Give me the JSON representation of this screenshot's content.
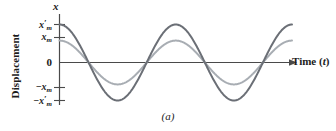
{
  "figure": {
    "caption": "(a)",
    "x_axis_symbol": "x",
    "x_axis_title": "Time (t)",
    "x_axis_title_main": "Time (",
    "x_axis_title_var": "t",
    "x_axis_title_end": ")",
    "y_axis_title": "Displacement"
  },
  "ticks": {
    "top_prime": "x′m",
    "top_prime_base": "x",
    "top_prime_mark": "′",
    "top_prime_sub": "m",
    "top_plain_base": "x",
    "top_plain_sub": "m",
    "zero": "0",
    "bottom_plain_base": "−x",
    "bottom_plain_sub": "m",
    "bottom_prime_base": "−x",
    "bottom_prime_mark": "′",
    "bottom_prime_sub": "m"
  },
  "colors": {
    "curve_large": "#6b6f76",
    "curve_small": "#a8adb3",
    "axis": "#4a4a4a",
    "text": "#1c1c1c",
    "background": "#ffffff"
  },
  "chart_data": {
    "type": "line",
    "title": "(a)",
    "xlabel": "Time (t)",
    "ylabel": "Displacement",
    "grid": false,
    "legend": "none",
    "xlim": [
      0,
      2.05
    ],
    "ylim": [
      -1.0,
      1.0
    ],
    "ytick_values": [
      0.78,
      0.45,
      0,
      -0.45,
      -0.78
    ],
    "ytick_labels": [
      "x′m",
      "xm",
      "0",
      "−xm",
      "−x′m"
    ],
    "xtick_values": [],
    "xtick_labels": [],
    "x_units": "periods",
    "series": [
      {
        "name": "large-amplitude",
        "color": "#6b6f76",
        "amplitude": 0.78,
        "amplitude_label": "x′m",
        "form": "x = x′m cos(2πt/T)",
        "periods_shown": 2.0,
        "linewidth": 2.0,
        "x": [
          0.0,
          0.1,
          0.2,
          0.25,
          0.3,
          0.4,
          0.5,
          0.6,
          0.7,
          0.75,
          0.8,
          0.9,
          1.0,
          1.1,
          1.2,
          1.25,
          1.3,
          1.4,
          1.5,
          1.6,
          1.7,
          1.75,
          1.8,
          1.9,
          2.0
        ],
        "y": [
          0.78,
          0.631,
          0.241,
          0.0,
          -0.241,
          -0.631,
          -0.78,
          -0.631,
          -0.241,
          0.0,
          0.241,
          0.631,
          0.78,
          0.631,
          0.241,
          0.0,
          -0.241,
          -0.631,
          -0.78,
          -0.631,
          -0.241,
          0.0,
          0.241,
          0.631,
          0.78
        ]
      },
      {
        "name": "small-amplitude",
        "color": "#a8adb3",
        "amplitude": 0.45,
        "amplitude_label": "xm",
        "form": "x = xm cos(2πt/T)",
        "periods_shown": 2.0,
        "linewidth": 2.0,
        "x": [
          0.0,
          0.1,
          0.2,
          0.25,
          0.3,
          0.4,
          0.5,
          0.6,
          0.7,
          0.75,
          0.8,
          0.9,
          1.0,
          1.1,
          1.2,
          1.25,
          1.3,
          1.4,
          1.5,
          1.6,
          1.7,
          1.75,
          1.8,
          1.9,
          2.0
        ],
        "y": [
          0.45,
          0.364,
          0.139,
          0.0,
          -0.139,
          -0.364,
          -0.45,
          -0.364,
          -0.139,
          0.0,
          0.139,
          0.364,
          0.45,
          0.364,
          0.139,
          0.0,
          -0.139,
          -0.364,
          -0.45,
          -0.364,
          -0.139,
          0.0,
          0.139,
          0.364,
          0.45
        ]
      }
    ],
    "annotations": [
      "x",
      "Time (t)",
      "Displacement",
      "(a)"
    ]
  }
}
